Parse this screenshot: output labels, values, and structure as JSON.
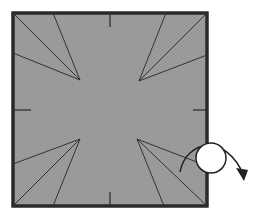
{
  "diagram": {
    "type": "origami-fold-step",
    "colors": {
      "paper": "#9a9a9a",
      "border": "#2a2a2a",
      "crease": "#333333",
      "background": "#ffffff",
      "circle_fill": "#ffffff"
    },
    "square": {
      "x": 13,
      "y": 13,
      "width": 194,
      "height": 193
    },
    "crease_groups": [
      {
        "name": "top-left",
        "apex": [
          80,
          80
        ],
        "ends": [
          [
            13,
            13
          ],
          [
            53,
            13
          ],
          [
            13,
            53
          ]
        ]
      },
      {
        "name": "top-right",
        "apex": [
          139,
          81
        ],
        "ends": [
          [
            207,
            13
          ],
          [
            166,
            13
          ],
          [
            207,
            55
          ]
        ]
      },
      {
        "name": "bottom-left",
        "apex": [
          80,
          139
        ],
        "ends": [
          [
            13,
            206
          ],
          [
            53,
            206
          ],
          [
            13,
            164
          ]
        ]
      },
      {
        "name": "bottom-right",
        "apex": [
          137,
          139
        ],
        "ends": [
          [
            207,
            206
          ],
          [
            164,
            206
          ],
          [
            207,
            166
          ]
        ]
      }
    ],
    "midpoint_ticks": [
      {
        "edge": "top",
        "x1": 110,
        "y1": 13,
        "x2": 110,
        "y2": 27
      },
      {
        "edge": "bottom",
        "x1": 110,
        "y1": 192,
        "x2": 110,
        "y2": 206
      },
      {
        "edge": "left",
        "x1": 13,
        "y1": 110,
        "x2": 31,
        "y2": 110
      },
      {
        "edge": "right",
        "x1": 193,
        "y1": 110,
        "x2": 207,
        "y2": 110
      }
    ],
    "turn_over_symbol": {
      "label": "turn over",
      "circle": {
        "cx": 211,
        "cy": 158,
        "r": 15
      },
      "arrow_path": "M 180 172 C 186 140, 226 132, 244 176",
      "arrowhead": [
        [
          244,
          181
        ],
        [
          236,
          168
        ],
        [
          248,
          170
        ]
      ]
    }
  }
}
